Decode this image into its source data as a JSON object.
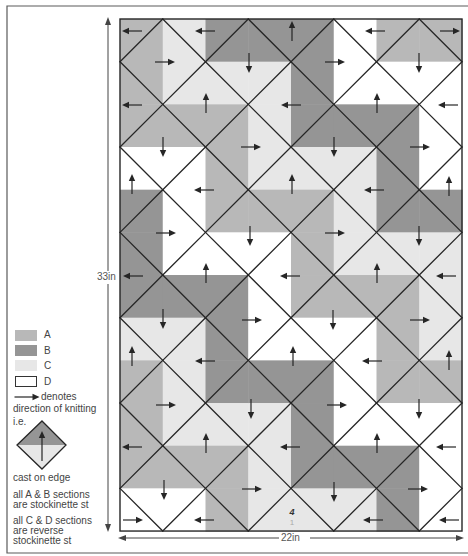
{
  "colors": {
    "A": "#b8b8b8",
    "B": "#959595",
    "C": "#e7e7e7",
    "D": "#ffffff",
    "line": "#262626",
    "text": "#444444",
    "frame": "#5a5a5a"
  },
  "diagram": {
    "grid": {
      "x": 120,
      "y": 19,
      "cols": 8,
      "rows": 12,
      "cell_w": 42.75,
      "cell_h": 42.67,
      "cells": [
        "ACBBBDAA",
        "ACCCBDDD",
        "AAACBBBD",
        "DDACCCBD",
        "BDAAACBB",
        "BDDDACCC",
        "BBBDAAAC",
        "CCBDDDAC",
        "ACBBBDAA",
        "ACCCBDDD",
        "AAACBBBD",
        "DDACCCBD"
      ]
    },
    "arrows": [
      {
        "x": 132,
        "y": 31,
        "dir": "left"
      },
      {
        "x": 205,
        "y": 31,
        "dir": "left"
      },
      {
        "x": 292,
        "y": 31,
        "dir": "up"
      },
      {
        "x": 375,
        "y": 31,
        "dir": "left"
      },
      {
        "x": 450,
        "y": 31,
        "dir": "right"
      },
      {
        "x": 165,
        "y": 62,
        "dir": "right"
      },
      {
        "x": 249,
        "y": 63,
        "dir": "down"
      },
      {
        "x": 335,
        "y": 62,
        "dir": "right"
      },
      {
        "x": 419,
        "y": 63,
        "dir": "down"
      },
      {
        "x": 132,
        "y": 105,
        "dir": "left"
      },
      {
        "x": 206,
        "y": 103,
        "dir": "up"
      },
      {
        "x": 291,
        "y": 105,
        "dir": "left"
      },
      {
        "x": 377,
        "y": 103,
        "dir": "up"
      },
      {
        "x": 448,
        "y": 105,
        "dir": "left"
      },
      {
        "x": 163,
        "y": 147,
        "dir": "down"
      },
      {
        "x": 251,
        "y": 147,
        "dir": "right"
      },
      {
        "x": 334,
        "y": 147,
        "dir": "down"
      },
      {
        "x": 420,
        "y": 147,
        "dir": "right"
      },
      {
        "x": 132,
        "y": 184,
        "dir": "up"
      },
      {
        "x": 204,
        "y": 190,
        "dir": "left"
      },
      {
        "x": 292,
        "y": 184,
        "dir": "up"
      },
      {
        "x": 374,
        "y": 190,
        "dir": "left"
      },
      {
        "x": 449,
        "y": 186,
        "dir": "up"
      },
      {
        "x": 166,
        "y": 233,
        "dir": "right"
      },
      {
        "x": 250,
        "y": 236,
        "dir": "down"
      },
      {
        "x": 335,
        "y": 233,
        "dir": "right"
      },
      {
        "x": 419,
        "y": 236,
        "dir": "down"
      },
      {
        "x": 133,
        "y": 276,
        "dir": "left"
      },
      {
        "x": 206,
        "y": 273,
        "dir": "up"
      },
      {
        "x": 290,
        "y": 276,
        "dir": "left"
      },
      {
        "x": 377,
        "y": 273,
        "dir": "up"
      },
      {
        "x": 446,
        "y": 276,
        "dir": "left"
      },
      {
        "x": 163,
        "y": 319,
        "dir": "down"
      },
      {
        "x": 252,
        "y": 320,
        "dir": "right"
      },
      {
        "x": 333,
        "y": 320,
        "dir": "down"
      },
      {
        "x": 420,
        "y": 320,
        "dir": "right"
      },
      {
        "x": 132,
        "y": 356,
        "dir": "up"
      },
      {
        "x": 205,
        "y": 361,
        "dir": "left"
      },
      {
        "x": 293,
        "y": 356,
        "dir": "up"
      },
      {
        "x": 372,
        "y": 361,
        "dir": "left"
      },
      {
        "x": 449,
        "y": 360,
        "dir": "up"
      },
      {
        "x": 166,
        "y": 405,
        "dir": "right"
      },
      {
        "x": 251,
        "y": 409,
        "dir": "down"
      },
      {
        "x": 337,
        "y": 405,
        "dir": "right"
      },
      {
        "x": 419,
        "y": 409,
        "dir": "down"
      },
      {
        "x": 132,
        "y": 447,
        "dir": "left"
      },
      {
        "x": 206,
        "y": 443,
        "dir": "up"
      },
      {
        "x": 290,
        "y": 447,
        "dir": "left"
      },
      {
        "x": 377,
        "y": 443,
        "dir": "up"
      },
      {
        "x": 446,
        "y": 447,
        "dir": "left"
      },
      {
        "x": 164,
        "y": 490,
        "dir": "down"
      },
      {
        "x": 252,
        "y": 489,
        "dir": "right"
      },
      {
        "x": 334,
        "y": 492,
        "dir": "down"
      },
      {
        "x": 418,
        "y": 489,
        "dir": "right"
      },
      {
        "x": 133,
        "y": 520,
        "dir": "right"
      },
      {
        "x": 204,
        "y": 520,
        "dir": "left"
      },
      {
        "x": 373,
        "y": 520,
        "dir": "left"
      },
      {
        "x": 449,
        "y": 520,
        "dir": "left"
      }
    ],
    "marker": {
      "x": 292,
      "y": 515,
      "top": "4",
      "bottom": "1"
    },
    "dimensions": {
      "height_label": "33in",
      "width_label": "22in"
    }
  },
  "legend": {
    "swatches": [
      {
        "key": "A",
        "label": "A"
      },
      {
        "key": "B",
        "label": "B"
      },
      {
        "key": "C",
        "label": "C"
      },
      {
        "key": "D",
        "label": "D"
      }
    ],
    "arrow_text": "denotes",
    "direction_text": "direction of knitting",
    "ie_text": "i.e.",
    "example": {
      "top_color": "B",
      "bottom_color": "C",
      "arrow": "up"
    },
    "cast_on_text": "cast on edge",
    "note_ab": [
      "all A & B sections",
      "are stockinette st"
    ],
    "note_cd": [
      "all C & D sections",
      "are reverse",
      "stockinette st"
    ]
  }
}
